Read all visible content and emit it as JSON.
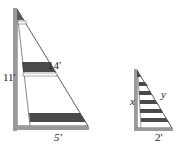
{
  "diagram": {
    "large_triangle": {
      "labels": {
        "vertical_leg": "11'",
        "hypotenuse": "14'",
        "base": "5'"
      },
      "dark_bands": 2
    },
    "small_triangle": {
      "labels": {
        "vertical_leg": "x",
        "hypotenuse": "y",
        "base": "2'"
      },
      "stripes": 6
    },
    "colors": {
      "frame": "#9a9a9a",
      "band": "#4a4a4a",
      "line": "#333333"
    }
  }
}
